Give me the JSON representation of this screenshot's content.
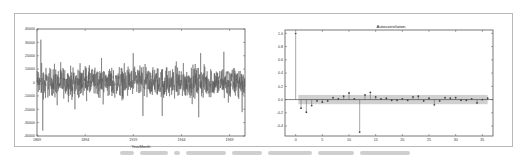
{
  "figure": {
    "border_color": "#b8b8b8",
    "line_color": "#555555",
    "band_color": "#c8c8c8"
  },
  "chart_data": [
    {
      "type": "line",
      "title": "",
      "xlabel": "YearMonth",
      "ylabel": "",
      "ylim": [
        -40000,
        40000
      ],
      "yticks": [
        40000,
        30000,
        20000,
        10000,
        0,
        -10000,
        -20000,
        -30000,
        -40000
      ],
      "ytick_labels": [
        "40000",
        "30000",
        "20000",
        "10000",
        "0",
        "-10000",
        "-20000",
        "-30000",
        "-40000"
      ],
      "xticks": [
        "1869",
        "1894",
        "1919",
        "1944",
        "1969"
      ],
      "x_range": [
        1869,
        1977
      ],
      "series": [
        {
          "name": "differenced series",
          "description": "stationary noisy series centered at 0, typical range about -15000 to 15000, occasional spikes",
          "notable_points": [
            {
              "x": 1871,
              "y": 32000
            },
            {
              "x": 1872,
              "y": -36000
            },
            {
              "x": 1919,
              "y": 22000
            },
            {
              "x": 1924,
              "y": -25000
            },
            {
              "x": 1934,
              "y": -25000
            },
            {
              "x": 1954,
              "y": 22000
            },
            {
              "x": 1953,
              "y": -26000
            },
            {
              "x": 1966,
              "y": 23000
            }
          ]
        }
      ]
    },
    {
      "type": "scatter",
      "subtype": "stem",
      "title": "Autocorrelation",
      "xlabel": "",
      "ylabel": "",
      "ylim": [
        -0.55,
        1.05
      ],
      "xlim": [
        -2,
        37
      ],
      "yticks": [
        1.0,
        0.8,
        0.6,
        0.4,
        0.2,
        0.0,
        -0.2,
        -0.4
      ],
      "ytick_labels": [
        "1.0",
        "0.8",
        "0.6",
        "0.4",
        "0.2",
        "0.0",
        "-0.2",
        "-0.4"
      ],
      "xticks": [
        0,
        5,
        10,
        15,
        20,
        25,
        30,
        35
      ],
      "xtick_labels": [
        "0",
        "5",
        "10",
        "15",
        "20",
        "25",
        "30",
        "35"
      ],
      "confidence_band": [
        -0.07,
        0.07
      ],
      "lags": [
        0,
        1,
        2,
        3,
        4,
        5,
        6,
        7,
        8,
        9,
        10,
        11,
        12,
        13,
        14,
        15,
        16,
        17,
        18,
        19,
        20,
        21,
        22,
        23,
        24,
        25,
        26,
        27,
        28,
        29,
        30,
        31,
        32,
        33,
        34,
        35,
        36
      ],
      "values": [
        1.0,
        -0.13,
        -0.19,
        -0.09,
        -0.02,
        -0.04,
        -0.02,
        0.03,
        0.01,
        0.05,
        0.1,
        0.01,
        -0.49,
        0.07,
        0.11,
        0.04,
        0.01,
        0.02,
        -0.01,
        -0.01,
        0.01,
        -0.01,
        0.04,
        0.05,
        -0.02,
        0.02,
        -0.08,
        -0.02,
        0.03,
        0.02,
        0.03,
        -0.01,
        -0.01,
        0.01,
        -0.05,
        0.0,
        0.02
      ]
    }
  ]
}
